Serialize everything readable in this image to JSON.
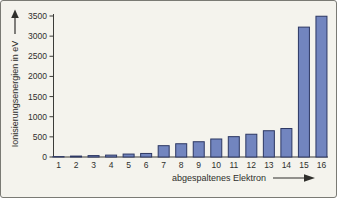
{
  "chart_data": {
    "type": "bar",
    "title": "",
    "ylabel": "Ionisierungsenergien in eV",
    "xlabel": "abgespaltenes Elektron",
    "categories": [
      "1",
      "2",
      "3",
      "4",
      "5",
      "6",
      "7",
      "8",
      "9",
      "10",
      "11",
      "12",
      "13",
      "14",
      "15",
      "16"
    ],
    "values": [
      10,
      23,
      35,
      47,
      73,
      88,
      281,
      329,
      379,
      447,
      505,
      565,
      652,
      707,
      3224,
      3494
    ],
    "ylim": [
      0,
      3500
    ],
    "yticks": [
      0,
      500,
      1000,
      1500,
      2000,
      2500,
      3000,
      3500
    ],
    "ytick_unit": "eV",
    "grid": false,
    "legend": "none",
    "colors": {
      "bar_fill": "#7285bf",
      "bar_stroke": "#2c3763",
      "axis": "#3b3b38",
      "text": "#2f2f2c",
      "background": "#f4f3ed",
      "frame_border": "#7a7a74"
    }
  }
}
